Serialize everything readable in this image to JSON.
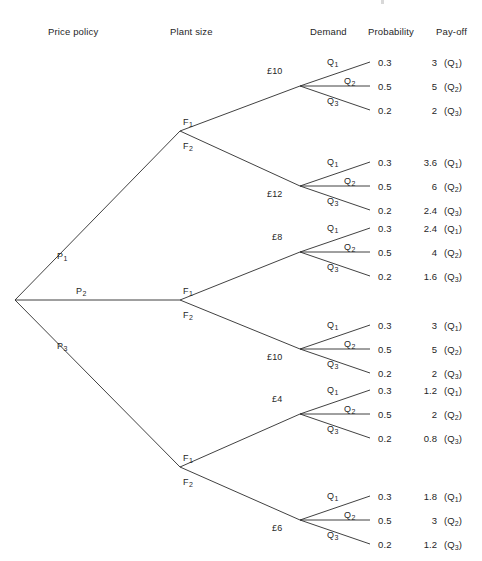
{
  "headers": [
    {
      "label": "Price policy",
      "x": 48,
      "y": 26
    },
    {
      "label": "Plant size",
      "x": 170,
      "y": 26
    },
    {
      "label": "Demand",
      "x": 310,
      "y": 26
    },
    {
      "label": "Probability",
      "x": 368,
      "y": 26
    },
    {
      "label": "Pay-off",
      "x": 436,
      "y": 26
    }
  ],
  "root": {
    "x": 15,
    "y": 300
  },
  "price_branches": [
    {
      "label": "P",
      "sub": "1",
      "label_x": 57,
      "label_y": 251,
      "node_x": 180,
      "node_y": 131
    },
    {
      "label": "P",
      "sub": "2",
      "label_x": 76,
      "label_y": 286,
      "node_x": 180,
      "node_y": 300
    },
    {
      "label": "P",
      "sub": "3",
      "label_x": 57,
      "label_y": 341,
      "node_x": 180,
      "node_y": 467
    }
  ],
  "plant_branches": [
    {
      "label": "F",
      "sub": "1",
      "label_x": 183,
      "label_y": 117,
      "fan_x": 300,
      "fan_y": 86
    },
    {
      "label": "F",
      "sub": "2",
      "label_x": 183,
      "label_y": 141,
      "fan_x": 300,
      "fan_y": 186
    },
    {
      "label": "F",
      "sub": "1",
      "label_x": 183,
      "label_y": 286,
      "fan_x": 300,
      "fan_y": 252
    },
    {
      "label": "F",
      "sub": "2",
      "label_x": 183,
      "label_y": 310,
      "fan_x": 300,
      "fan_y": 349
    },
    {
      "label": "F",
      "sub": "1",
      "label_x": 183,
      "label_y": 453,
      "fan_x": 300,
      "fan_y": 414
    },
    {
      "label": "F",
      "sub": "2",
      "label_x": 183,
      "label_y": 477,
      "fan_x": 300,
      "fan_y": 520
    }
  ],
  "groups": [
    {
      "plant_cost": "£10",
      "cost_x": 267,
      "cost_y": 66,
      "fan_x": 300,
      "fan_y": 86,
      "end_x": 370,
      "outcomes": [
        {
          "demand": "Q",
          "demand_sub": "1",
          "demand_x": 327,
          "demand_y": 57,
          "prob": "0.3",
          "payoff": "3",
          "payoff_q": "(Q",
          "payoff_q_sub": "1",
          "end_y": 62,
          "text_y": 57
        },
        {
          "demand": "Q",
          "demand_sub": "2",
          "demand_x": 344,
          "demand_y": 76,
          "prob": "0.5",
          "payoff": "5",
          "payoff_q": "(Q",
          "payoff_q_sub": "2",
          "end_y": 86,
          "text_y": 81
        },
        {
          "demand": "Q",
          "demand_sub": "3",
          "demand_x": 327,
          "demand_y": 96,
          "prob": "0.2",
          "payoff": "2",
          "payoff_q": "(Q",
          "payoff_q_sub": "3",
          "end_y": 110,
          "text_y": 105
        }
      ]
    },
    {
      "plant_cost": "£12",
      "cost_x": 267,
      "cost_y": 189,
      "fan_x": 300,
      "fan_y": 186,
      "end_x": 370,
      "outcomes": [
        {
          "demand": "Q",
          "demand_sub": "1",
          "demand_x": 327,
          "demand_y": 157,
          "prob": "0.3",
          "payoff": "3.6",
          "payoff_q": "(Q",
          "payoff_q_sub": "1",
          "end_y": 162,
          "text_y": 157
        },
        {
          "demand": "Q",
          "demand_sub": "2",
          "demand_x": 344,
          "demand_y": 176,
          "prob": "0.5",
          "payoff": "6",
          "payoff_q": "(Q",
          "payoff_q_sub": "2",
          "end_y": 186,
          "text_y": 181
        },
        {
          "demand": "Q",
          "demand_sub": "3",
          "demand_x": 327,
          "demand_y": 196,
          "prob": "0.2",
          "payoff": "2.4",
          "payoff_q": "(Q",
          "payoff_q_sub": "3",
          "end_y": 210,
          "text_y": 205
        }
      ]
    },
    {
      "plant_cost": "£8",
      "cost_x": 272,
      "cost_y": 232,
      "fan_x": 300,
      "fan_y": 252,
      "end_x": 370,
      "outcomes": [
        {
          "demand": "Q",
          "demand_sub": "1",
          "demand_x": 327,
          "demand_y": 223,
          "prob": "0.3",
          "payoff": "2.4",
          "payoff_q": "(Q",
          "payoff_q_sub": "1",
          "end_y": 228,
          "text_y": 223
        },
        {
          "demand": "Q",
          "demand_sub": "2",
          "demand_x": 344,
          "demand_y": 242,
          "prob": "0.5",
          "payoff": "4",
          "payoff_q": "(Q",
          "payoff_q_sub": "2",
          "end_y": 252,
          "text_y": 247
        },
        {
          "demand": "Q",
          "demand_sub": "3",
          "demand_x": 327,
          "demand_y": 262,
          "prob": "0.2",
          "payoff": "1.6",
          "payoff_q": "(Q",
          "payoff_q_sub": "3",
          "end_y": 276,
          "text_y": 271
        }
      ]
    },
    {
      "plant_cost": "£10",
      "cost_x": 267,
      "cost_y": 352,
      "fan_x": 300,
      "fan_y": 349,
      "end_x": 370,
      "outcomes": [
        {
          "demand": "Q",
          "demand_sub": "1",
          "demand_x": 327,
          "demand_y": 320,
          "prob": "0.3",
          "payoff": "3",
          "payoff_q": "(Q",
          "payoff_q_sub": "1",
          "end_y": 325,
          "text_y": 320
        },
        {
          "demand": "Q",
          "demand_sub": "2",
          "demand_x": 344,
          "demand_y": 339,
          "prob": "0.5",
          "payoff": "5",
          "payoff_q": "(Q",
          "payoff_q_sub": "2",
          "end_y": 349,
          "text_y": 344
        },
        {
          "demand": "Q",
          "demand_sub": "3",
          "demand_x": 327,
          "demand_y": 359,
          "prob": "0.2",
          "payoff": "2",
          "payoff_q": "(Q",
          "payoff_q_sub": "3",
          "end_y": 373,
          "text_y": 368
        }
      ]
    },
    {
      "plant_cost": "£4",
      "cost_x": 272,
      "cost_y": 394,
      "fan_x": 300,
      "fan_y": 414,
      "end_x": 370,
      "outcomes": [
        {
          "demand": "Q",
          "demand_sub": "1",
          "demand_x": 327,
          "demand_y": 385,
          "prob": "0.3",
          "payoff": "1.2",
          "payoff_q": "(Q",
          "payoff_q_sub": "1",
          "end_y": 390,
          "text_y": 385
        },
        {
          "demand": "Q",
          "demand_sub": "2",
          "demand_x": 344,
          "demand_y": 404,
          "prob": "0.5",
          "payoff": "2",
          "payoff_q": "(Q",
          "payoff_q_sub": "2",
          "end_y": 414,
          "text_y": 409
        },
        {
          "demand": "Q",
          "demand_sub": "3",
          "demand_x": 327,
          "demand_y": 424,
          "prob": "0.2",
          "payoff": "0.8",
          "payoff_q": "(Q",
          "payoff_q_sub": "3",
          "end_y": 438,
          "text_y": 433
        }
      ]
    },
    {
      "plant_cost": "£6",
      "cost_x": 272,
      "cost_y": 523,
      "fan_x": 300,
      "fan_y": 520,
      "end_x": 370,
      "outcomes": [
        {
          "demand": "Q",
          "demand_sub": "1",
          "demand_x": 327,
          "demand_y": 491,
          "prob": "0.3",
          "payoff": "1.8",
          "payoff_q": "(Q",
          "payoff_q_sub": "1",
          "end_y": 496,
          "text_y": 491
        },
        {
          "demand": "Q",
          "demand_sub": "2",
          "demand_x": 344,
          "demand_y": 510,
          "prob": "0.5",
          "payoff": "3",
          "payoff_q": "(Q",
          "payoff_q_sub": "2",
          "end_y": 520,
          "text_y": 515
        },
        {
          "demand": "Q",
          "demand_sub": "3",
          "demand_x": 327,
          "demand_y": 530,
          "prob": "0.2",
          "payoff": "1.2",
          "payoff_q": "(Q",
          "payoff_q_sub": "3",
          "end_y": 544,
          "text_y": 539
        }
      ]
    }
  ],
  "style": {
    "line_color": "#2b2b2b",
    "text_color": "#1f1f1f",
    "background": "#ffffff"
  }
}
